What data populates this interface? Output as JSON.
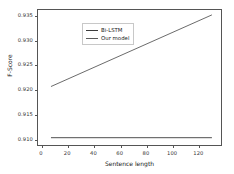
{
  "chart_data": {
    "type": "line",
    "title": "",
    "xlabel": "Sentence length",
    "ylabel": "F-Score",
    "xlim": [
      -3,
      138
    ],
    "ylim": [
      0.9085,
      0.9362
    ],
    "xticks": [
      0,
      20,
      40,
      60,
      80,
      100,
      120
    ],
    "xtick_labels": [
      "0",
      "20",
      "40",
      "60",
      "80",
      "100",
      "120"
    ],
    "yticks": [
      0.91,
      0.915,
      0.92,
      0.925,
      0.93,
      0.935
    ],
    "ytick_labels": [
      "0.910",
      "0.915",
      "0.920",
      "0.925",
      "0.930",
      "0.935"
    ],
    "grid": false,
    "legend_position": "upper left",
    "series": [
      {
        "name": "Bi-LSTM",
        "color": "#3c3c3c",
        "x": [
          7,
          131
        ],
        "values": [
          0.91,
          0.91
        ]
      },
      {
        "name": "Our model",
        "color": "#5a5a5a",
        "x": [
          7,
          131
        ],
        "values": [
          0.9205,
          0.9352
        ]
      }
    ]
  },
  "legend": {
    "entries": [
      {
        "label": "Bi-LSTM"
      },
      {
        "label": "Our model"
      }
    ]
  },
  "axes": {
    "x_title": "Sentence length",
    "y_title": "F-Score"
  }
}
